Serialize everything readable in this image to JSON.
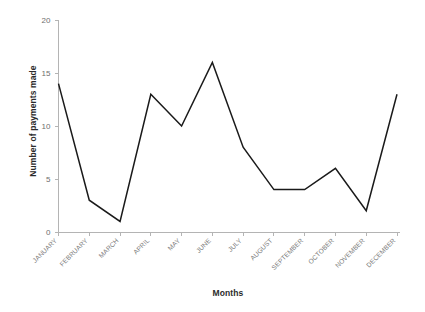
{
  "chart_data": {
    "type": "line",
    "title": "",
    "subtitle": "",
    "xlabel": "Months",
    "ylabel": "Number of payments made",
    "categories": [
      "JANUARY",
      "FEBRUARY",
      "MARCH",
      "APRIL",
      "MAY",
      "JUNE",
      "JULY",
      "AUGUST",
      "SEPTEMBER",
      "OCTOBER",
      "NOVEMBER",
      "DECEMBER"
    ],
    "values": [
      14,
      3,
      1,
      13,
      10,
      16,
      8,
      4,
      4,
      6,
      2,
      13
    ],
    "series": [
      {
        "name": "Number of payments made",
        "values": [
          14,
          3,
          1,
          13,
          10,
          16,
          8,
          4,
          4,
          6,
          2,
          13
        ]
      }
    ],
    "ylim": [
      0,
      20
    ],
    "ytick_labels": [
      "0",
      "5",
      "10",
      "15",
      "20"
    ],
    "ytick_values": [
      0,
      5,
      10,
      15,
      20
    ],
    "xtick_labels": [
      "JANUARY",
      "FEBRUARY",
      "MARCH",
      "APRIL",
      "MAY",
      "JUNE",
      "JULY",
      "AUGUST",
      "SEPTEMBER",
      "OCTOBER",
      "NOVEMBER",
      "DECEMBER"
    ],
    "grid": false,
    "legend": false,
    "legend_position": "none",
    "line_color": "#1a1a1a",
    "axis_color": "#b4b4b4",
    "tick_label_color": "#7b7b7b",
    "axis_title_color": "#2b2b2b",
    "background_color": "#ffffff",
    "xtick_label_rotation": -45
  }
}
